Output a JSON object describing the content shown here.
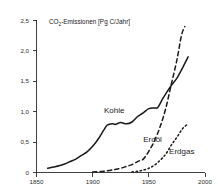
{
  "chart_data": {
    "type": "line",
    "title": "CO2-Emissionen [Pg C/Jahr]",
    "title_parts": {
      "prefix": "CO",
      "subscript": "2",
      "suffix": "-Emissionen [Pg C/Jahr]"
    },
    "xlabel": "",
    "ylabel": "CO2-Emissionen [Pg C/Jahr]",
    "xlim": [
      1850,
      2000
    ],
    "ylim": [
      0,
      2.5
    ],
    "grid": false,
    "legend_position": "inline-labels",
    "x_ticks": [
      "1850",
      "1900",
      "1950",
      "2000"
    ],
    "x_tick_values": [
      1850,
      1900,
      1950,
      2000
    ],
    "y_ticks": [
      "0",
      "0,5",
      "1,0",
      "1,5",
      "2,0",
      "2,5"
    ],
    "y_tick_values": [
      0,
      0.5,
      1.0,
      1.5,
      2.0,
      2.5
    ],
    "series": [
      {
        "name": "Kohle",
        "style": "solid",
        "label": "Kohle",
        "x": [
          1860,
          1865,
          1870,
          1875,
          1880,
          1885,
          1890,
          1895,
          1900,
          1905,
          1910,
          1913,
          1918,
          1920,
          1925,
          1930,
          1935,
          1940,
          1945,
          1950,
          1955,
          1958,
          1962,
          1966,
          1970,
          1975,
          1980,
          1985
        ],
        "values": [
          0.07,
          0.09,
          0.11,
          0.14,
          0.18,
          0.22,
          0.28,
          0.34,
          0.43,
          0.55,
          0.7,
          0.78,
          0.8,
          0.79,
          0.82,
          0.8,
          0.83,
          0.92,
          0.98,
          1.05,
          1.06,
          1.07,
          1.2,
          1.32,
          1.43,
          1.55,
          1.72,
          1.9
        ]
      },
      {
        "name": "Erdöl",
        "style": "dashed",
        "label": "Erdöl",
        "x": [
          1900,
          1910,
          1920,
          1925,
          1930,
          1935,
          1940,
          1945,
          1950,
          1955,
          1960,
          1965,
          1970,
          1975,
          1979,
          1982
        ],
        "values": [
          0.01,
          0.02,
          0.05,
          0.07,
          0.1,
          0.13,
          0.18,
          0.22,
          0.35,
          0.52,
          0.75,
          1.05,
          1.45,
          1.85,
          2.25,
          2.4
        ]
      },
      {
        "name": "Erdgas",
        "style": "dotted",
        "label": "Erdgas",
        "x": [
          1935,
          1940,
          1945,
          1950,
          1955,
          1960,
          1965,
          1970,
          1975,
          1980,
          1985
        ],
        "values": [
          0.01,
          0.02,
          0.04,
          0.07,
          0.12,
          0.2,
          0.3,
          0.45,
          0.58,
          0.72,
          0.8
        ]
      }
    ],
    "annotations": [
      {
        "text": "Kohle",
        "x": 1910,
        "y": 0.97
      },
      {
        "text": "Erdöl",
        "x": 1945,
        "y": 0.5
      },
      {
        "text": "Erdgas",
        "x": 1968,
        "y": 0.3
      }
    ],
    "colors": {
      "axis": "#2b2b2b",
      "line": "#1a1a1a",
      "background": "#ffffff"
    }
  }
}
